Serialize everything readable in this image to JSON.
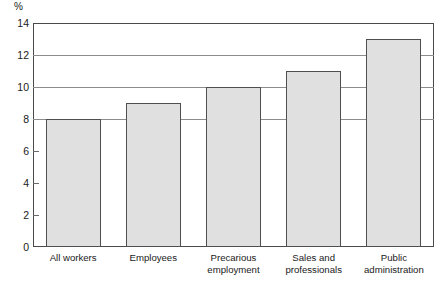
{
  "chart_data": {
    "type": "bar",
    "title": "",
    "subtitle": "",
    "xlabel": "",
    "ylabel": "%",
    "unit_label": "%",
    "categories": [
      "All workers",
      "Employees",
      "Precarious\nemployment",
      "Sales and\nprofessionals",
      "Public\nadministration"
    ],
    "values": [
      8,
      9,
      10,
      11,
      13
    ],
    "ylim": [
      0,
      14
    ],
    "ytick_labels": [
      "0",
      "2",
      "4",
      "6",
      "8",
      "10",
      "12",
      "14"
    ],
    "ytick_values": [
      0,
      2,
      4,
      6,
      8,
      10,
      12,
      14
    ],
    "gridline_values": [
      8,
      10,
      12
    ],
    "grid": true,
    "legend": null,
    "legend_position": "none",
    "annotations": [],
    "colors": {
      "bar_fill": "#e0e0e0",
      "bar_stroke": "#4f4f4f",
      "frame": "#4a4a4a",
      "gridline": "#8c8c8c",
      "text": "#1a1a1a",
      "background": "#ffffff"
    }
  }
}
